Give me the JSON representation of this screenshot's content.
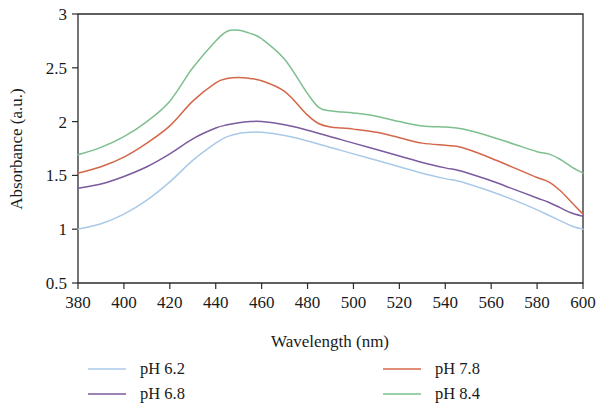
{
  "figure": {
    "background": "#ffffff",
    "axis_color": "#2b2b2b",
    "text_color": "#1a1a1a"
  },
  "chart_data": {
    "type": "line",
    "title": "",
    "subtitle": "",
    "xlabel": "Wavelength (nm)",
    "ylabel": "Absorbance (a.u.)",
    "xlim": [
      380,
      600
    ],
    "ylim": [
      0.5,
      3
    ],
    "xticks": [
      380,
      400,
      420,
      440,
      460,
      480,
      500,
      520,
      540,
      560,
      580,
      600
    ],
    "yticks": [
      0.5,
      1,
      1.5,
      2,
      2.5,
      3
    ],
    "xtick_labels": [
      "380",
      "400",
      "420",
      "440",
      "460",
      "480",
      "500",
      "520",
      "540",
      "560",
      "580",
      "600"
    ],
    "ytick_labels": [
      "0.5",
      "1",
      "1.5",
      "2",
      "2.5",
      "3"
    ],
    "grid": false,
    "legend_position": "below-two-columns",
    "x": [
      380,
      390,
      400,
      410,
      420,
      430,
      440,
      445,
      450,
      455,
      460,
      470,
      480,
      485,
      490,
      495,
      500,
      510,
      520,
      530,
      540,
      545,
      550,
      560,
      570,
      580,
      585,
      590,
      595,
      600
    ],
    "series": [
      {
        "name": "pH 6.2",
        "color": "#A9C9E8",
        "values": [
          1.0,
          1.05,
          1.14,
          1.27,
          1.44,
          1.64,
          1.8,
          1.86,
          1.89,
          1.9,
          1.9,
          1.87,
          1.82,
          1.79,
          1.76,
          1.73,
          1.7,
          1.64,
          1.58,
          1.52,
          1.47,
          1.45,
          1.42,
          1.35,
          1.27,
          1.18,
          1.13,
          1.08,
          1.03,
          1.0
        ]
      },
      {
        "name": "pH 6.8",
        "color": "#7B5A9E",
        "values": [
          1.38,
          1.42,
          1.49,
          1.58,
          1.7,
          1.84,
          1.94,
          1.97,
          1.99,
          2.0,
          2.0,
          1.97,
          1.92,
          1.89,
          1.86,
          1.83,
          1.8,
          1.74,
          1.68,
          1.62,
          1.57,
          1.55,
          1.52,
          1.45,
          1.37,
          1.29,
          1.25,
          1.2,
          1.15,
          1.12
        ]
      },
      {
        "name": "pH 7.8",
        "color": "#D4674A"
      },
      {
        "name": "pH 8.4",
        "color": "#7DBF8E"
      }
    ],
    "series_values_extra": {
      "pH 7.8": [
        1.52,
        1.58,
        1.67,
        1.8,
        1.96,
        2.19,
        2.36,
        2.4,
        2.41,
        2.4,
        2.38,
        2.28,
        2.06,
        1.98,
        1.95,
        1.94,
        1.93,
        1.9,
        1.85,
        1.8,
        1.78,
        1.77,
        1.74,
        1.66,
        1.57,
        1.48,
        1.44,
        1.36,
        1.25,
        1.14
      ],
      "pH 8.4": [
        1.69,
        1.76,
        1.86,
        2.0,
        2.19,
        2.5,
        2.75,
        2.84,
        2.85,
        2.82,
        2.77,
        2.58,
        2.26,
        2.13,
        2.1,
        2.09,
        2.08,
        2.05,
        2.0,
        1.96,
        1.95,
        1.94,
        1.92,
        1.86,
        1.79,
        1.72,
        1.7,
        1.65,
        1.58,
        1.52
      ]
    }
  },
  "legend": {
    "column_left": [
      {
        "label": "pH 6.2",
        "color": "#A9C9E8"
      },
      {
        "label": "pH 6.8",
        "color": "#7B5A9E"
      }
    ],
    "column_right": [
      {
        "label": "pH 7.8",
        "color": "#D4674A"
      },
      {
        "label": "pH 8.4",
        "color": "#7DBF8E"
      }
    ]
  }
}
